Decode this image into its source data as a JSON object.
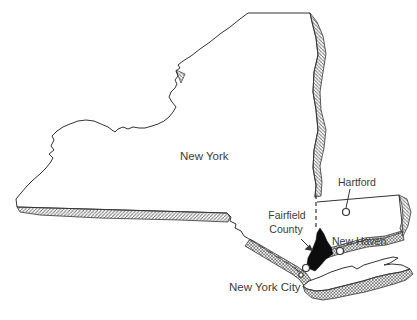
{
  "figure": {
    "type": "map",
    "background": "#ffffff",
    "ink_color": "#333333",
    "hatch_color": "#6b6b6b",
    "highlight_fill": "#0d0d0d",
    "marker_fill": "#ffffff"
  },
  "labels": {
    "new_york": "New York",
    "hartford": "Hartford",
    "fairfield_line1": "Fairfield",
    "fairfield_line2": "County",
    "new_haven": "New Haven",
    "new_york_city": "New York City"
  },
  "regions": [
    {
      "name": "New York",
      "style": "white outline with hatched shadow borders"
    },
    {
      "name": "Connecticut",
      "style": "white outline with hatched east and coast shadow"
    },
    {
      "name": "Long Island",
      "style": "white outline with hatched south shore"
    },
    {
      "name": "Fairfield County",
      "style": "solid black highlight"
    }
  ],
  "markers": [
    {
      "name": "Hartford",
      "shape": "ring"
    },
    {
      "name": "New Haven",
      "shape": "ring"
    },
    {
      "name": "New York City",
      "shape": "double-ring"
    }
  ]
}
